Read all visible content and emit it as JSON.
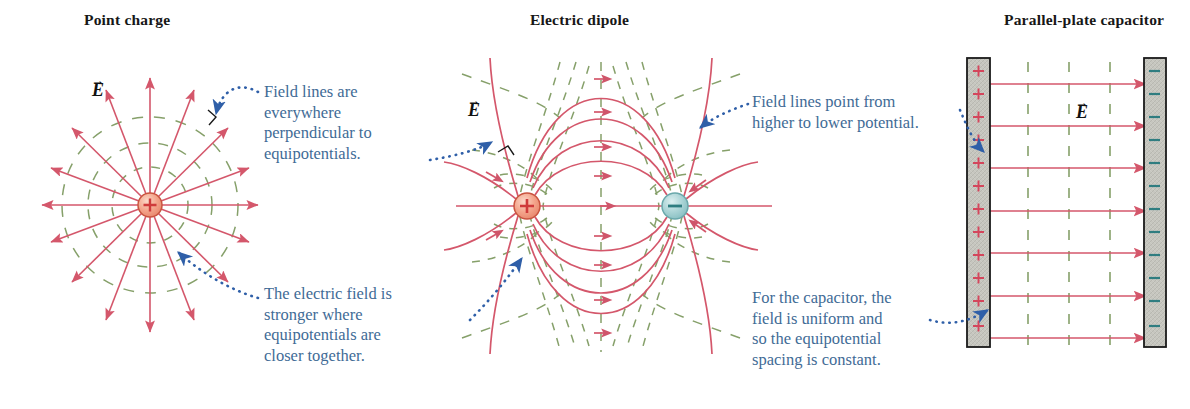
{
  "figure": {
    "kind": "physics-diagram",
    "background_color": "#ffffff",
    "field_line_color": "#d4576b",
    "equipotential_color": "#86a06a",
    "callout_text_color": "#3f6b96",
    "callout_dot_color": "#2f5fa8",
    "positive_charge_color": "#f2a08a",
    "negative_charge_color": "#a8d2d4",
    "plate_fill_color": "#c4c4bd",
    "plate_edge_color": "#1a1a1a"
  },
  "panels": [
    {
      "id": "point-charge",
      "title": "Point charge",
      "title_x": 84,
      "title_y": 18,
      "field_vector_label": "E",
      "charges": [
        {
          "sign": "+",
          "cx": 150,
          "cy": 205,
          "r": 12
        }
      ],
      "field_line_count": 16,
      "equipotential_count": 3,
      "equipotential_radii": [
        38,
        62,
        88
      ]
    },
    {
      "id": "electric-dipole",
      "title": "Electric dipole",
      "title_x": 530,
      "title_y": 18,
      "field_vector_label": "E",
      "charges": [
        {
          "sign": "+",
          "cx": 527,
          "cy": 206,
          "r": 13
        },
        {
          "sign": "-",
          "cx": 675,
          "cy": 206,
          "r": 13
        }
      ],
      "field_line_count": 13,
      "equipotential_count": 10
    },
    {
      "id": "parallel-plate-capacitor",
      "title": "Parallel-plate capacitor",
      "title_x": 1004,
      "title_y": 18,
      "field_vector_label": "E",
      "left_plate": {
        "charge_sign": "+",
        "charge_count": 12,
        "x": 967,
        "y": 58,
        "width": 23,
        "height": 289
      },
      "right_plate": {
        "charge_sign": "-",
        "charge_count": 12,
        "x": 1144,
        "y": 58,
        "width": 22,
        "height": 289
      },
      "field_arrow_count": 7,
      "equipotential_lines_x": [
        1028,
        1069,
        1110
      ],
      "equipotential_count": 3
    }
  ],
  "callouts": [
    {
      "id": "perpendicular",
      "text": "Field lines are\neverywhere\nperpendicular to\nequipotentials.",
      "x": 264,
      "y": 82,
      "width": 200
    },
    {
      "id": "stronger-field",
      "text": "The electric field is\nstronger where\nequipotentials are\ncloser together.",
      "x": 264,
      "y": 284,
      "width": 210
    },
    {
      "id": "higher-to-lower",
      "text": "Field lines point from\nhigher to lower potential.",
      "x": 752,
      "y": 92,
      "width": 240
    },
    {
      "id": "uniform-field",
      "text": "For the capacitor, the\nfield is uniform and\nso the equipotential\nspacing is constant.",
      "x": 752,
      "y": 288,
      "width": 220
    }
  ],
  "labels": {
    "point_charge_E": {
      "x": 92,
      "y": 80
    },
    "dipole_E": {
      "x": 468,
      "y": 100
    },
    "capacitor_E": {
      "x": 1076,
      "y": 102
    }
  }
}
